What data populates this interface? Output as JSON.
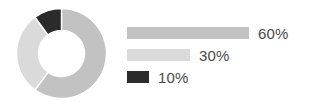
{
  "chart_data": {
    "type": "pie",
    "variant": "donut",
    "title": "",
    "subtitle": "",
    "xlabel": "",
    "ylabel": "",
    "grid": false,
    "legend_position": "right",
    "legend_style": "horizontal-bars",
    "start_angle_deg": 0,
    "direction": "clockwise",
    "inner_radius_ratio": 0.51,
    "categories": [
      "60%",
      "30%",
      "10%"
    ],
    "values": [
      60,
      30,
      10
    ],
    "value_unit": "%",
    "colors": [
      "#c2c2c2",
      "#dadada",
      "#2b2b2b"
    ],
    "slices": [
      {
        "label": "60%",
        "value": 60,
        "color": "#c2c2c2",
        "bar_width_px": 122
      },
      {
        "label": "30%",
        "value": 30,
        "color": "#dadada",
        "bar_width_px": 63
      },
      {
        "label": "10%",
        "value": 10,
        "color": "#2b2b2b",
        "bar_width_px": 22
      }
    ],
    "background": "#ffffff",
    "text_color": "#4a4a4a"
  },
  "donut": {
    "center_x": 45.5,
    "center_y": 45.5,
    "outer_radius": 45,
    "inner_radius": 23
  },
  "legend": {
    "rows": [
      {
        "label": "60%"
      },
      {
        "label": "30%"
      },
      {
        "label": "10%"
      }
    ]
  }
}
